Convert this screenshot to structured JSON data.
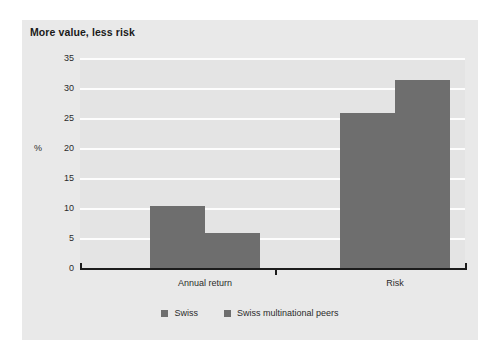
{
  "card": {
    "title": "More value, less risk"
  },
  "chart_data": {
    "type": "bar",
    "title": "More value, less risk",
    "xlabel": "",
    "ylabel": "%",
    "categories": [
      "Annual return",
      "Risk"
    ],
    "series": [
      {
        "name": "Swiss",
        "values": [
          10.4,
          25.8
        ],
        "color": "#6e6e6e"
      },
      {
        "name": "Swiss multinational peers",
        "values": [
          5.9,
          31.4
        ],
        "color": "#6e6e6e"
      }
    ],
    "ylim": [
      0,
      35
    ],
    "yticks": [
      0,
      5,
      10,
      15,
      20,
      25,
      30,
      35
    ],
    "ytick_labels": [
      "0",
      "5",
      "10",
      "15",
      "20",
      "25",
      "30",
      "35"
    ],
    "grid": true,
    "grid_color": "#fdfdfd",
    "plot_background": "#e4e4e4",
    "card_background": "#e9e9e9",
    "legend_position": "bottom-center",
    "legend": [
      "Swiss",
      "Swiss multinational peers"
    ],
    "unit_label": "%",
    "unit_label_at": 20
  }
}
